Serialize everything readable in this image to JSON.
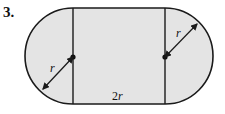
{
  "problem_number": "3.",
  "labels": {
    "radius_left": "r",
    "radius_right": "r",
    "width": "2r"
  },
  "colors": {
    "fill": "#e4e4e4",
    "stroke": "#1a1a1a"
  }
}
